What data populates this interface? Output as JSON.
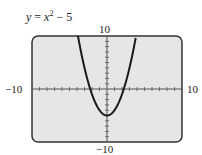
{
  "chart_data": {
    "type": "line",
    "equation": {
      "lhs": "y",
      "rhs_var": "x",
      "exponent": "2",
      "rest": " − 5"
    },
    "xlim": [
      -10,
      10
    ],
    "ylim": [
      -10,
      10
    ],
    "xscale": 1,
    "yscale": 1,
    "grid": false,
    "tick_labels": {
      "xmin": "−10",
      "xmax": "10",
      "ymin": "−10",
      "ymax": "10"
    },
    "series": [
      {
        "name": "y = x^2 − 5",
        "function": "x^2 - 5",
        "x": [
          -3.873,
          -3,
          -2,
          -1,
          0,
          1,
          2,
          3,
          3.873
        ],
        "y": [
          10,
          4,
          -1,
          -4,
          -5,
          -4,
          -1,
          4,
          10
        ]
      }
    ]
  },
  "colors": {
    "screen_bg": "#e6e6e6",
    "frame": "#333333",
    "curve": "#1a1a1a"
  }
}
